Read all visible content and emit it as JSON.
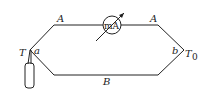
{
  "diagram": {
    "type": "thermocouple circuit",
    "labels": {
      "wire_top_left": "A",
      "wire_top_right": "A",
      "wire_bottom": "B",
      "junction_left": "a",
      "junction_right": "b",
      "temp_left": "T",
      "temp_right": "T",
      "temp_right_sub": "0",
      "meter": "mA"
    },
    "colors": {
      "line": "#222222",
      "background": "#ffffff"
    }
  }
}
